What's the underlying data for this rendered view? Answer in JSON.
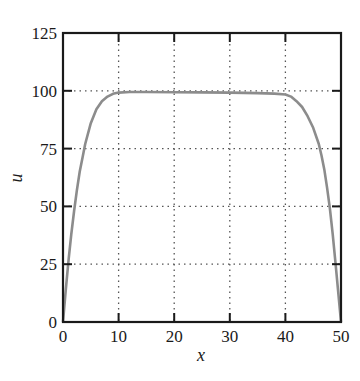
{
  "chart_data": {
    "type": "line",
    "title": "",
    "xlabel": "x",
    "ylabel": "u",
    "xlim": [
      0,
      50
    ],
    "ylim": [
      0,
      125
    ],
    "xticks": [
      0,
      10,
      20,
      30,
      40,
      50
    ],
    "yticks": [
      0,
      25,
      50,
      75,
      100,
      125
    ],
    "grid": true,
    "grid_style": "dotted",
    "legend": null,
    "series": [
      {
        "name": "u(x)",
        "color": "#8c8c8c",
        "x": [
          0,
          0.5,
          1,
          1.5,
          2,
          2.5,
          3,
          3.5,
          4,
          5,
          6,
          7,
          8,
          9,
          10,
          12,
          15,
          20,
          25,
          30,
          35,
          38,
          40,
          41,
          42,
          43,
          44,
          45,
          46,
          46.5,
          47,
          47.5,
          48,
          48.5,
          49,
          49.5,
          50
        ],
        "y": [
          0,
          14,
          27,
          38,
          48,
          57,
          65,
          71,
          77,
          86,
          92,
          95.5,
          97.5,
          98.7,
          99.2,
          99.5,
          99.5,
          99.4,
          99.3,
          99.2,
          99.0,
          98.8,
          98.4,
          97.5,
          95.5,
          93,
          89,
          84,
          77,
          72,
          66,
          58,
          49,
          38,
          26,
          13,
          0
        ]
      }
    ]
  }
}
